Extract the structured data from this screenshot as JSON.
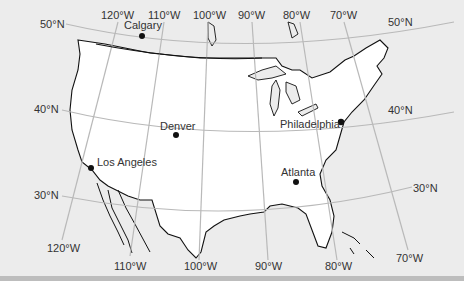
{
  "map": {
    "title": "Map of the United States with latitude and longitude lines",
    "colors": {
      "land_us": "#ffffff",
      "background": "#ececec",
      "graticule": "#b9b9b9",
      "coastline": "#111111",
      "city_dot": "#111111",
      "label": "#333333"
    },
    "latitude_labels": {
      "n50_left": "50°N",
      "n50_right": "50°N",
      "n40_left": "40°N",
      "n40_right": "40°N",
      "n30_left": "30°N",
      "n30_right": "30°N"
    },
    "longitude_labels_top": {
      "w120": "120°W",
      "w110": "110°W",
      "w100": "100°W",
      "w90": "90°W",
      "w80": "80°W",
      "w70": "70°W"
    },
    "longitude_labels_bottom": {
      "w120": "120°W",
      "w110": "110°W",
      "w100": "100°W",
      "w90": "90°W",
      "w80": "80°W",
      "w70": "70°W"
    },
    "cities": {
      "calgary": "Calgary",
      "denver": "Denver",
      "los_angeles": "Los Angeles",
      "atlanta": "Atlanta",
      "philadelphia": "Philadelphia"
    }
  }
}
